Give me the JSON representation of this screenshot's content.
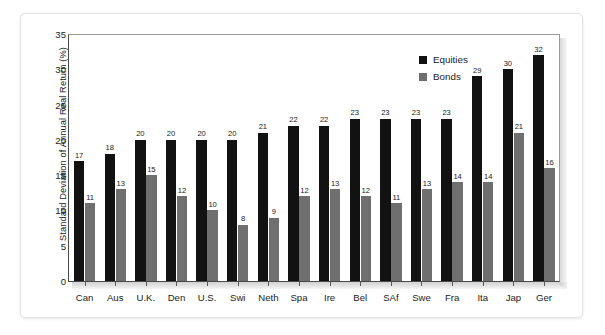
{
  "chart_data": {
    "type": "bar",
    "title": "",
    "xlabel": "",
    "ylabel": "Standard Deviation of Annual Real Return (%)",
    "ylim": [
      0,
      35
    ],
    "yticks": [
      0,
      5,
      10,
      15,
      20,
      25,
      30,
      35
    ],
    "grid": false,
    "legend_position": "top-right",
    "categories": [
      "Can",
      "Aus",
      "U.K.",
      "Den",
      "U.S.",
      "Swi",
      "Neth",
      "Spa",
      "Ire",
      "Bel",
      "SAf",
      "Swe",
      "Fra",
      "Ita",
      "Jap",
      "Ger"
    ],
    "series": [
      {
        "name": "Equities",
        "color": "#121212",
        "values": [
          17,
          18,
          20,
          20,
          20,
          20,
          21,
          22,
          22,
          23,
          23,
          23,
          23,
          29,
          30,
          32
        ]
      },
      {
        "name": "Bonds",
        "color": "#6f6f6f",
        "values": [
          11,
          13,
          15,
          12,
          10,
          8,
          9,
          12,
          13,
          12,
          11,
          13,
          14,
          14,
          21,
          16
        ]
      }
    ]
  },
  "legend": {
    "items": [
      {
        "label": "Equities",
        "color": "#121212"
      },
      {
        "label": "Bonds",
        "color": "#6f6f6f"
      }
    ]
  },
  "axis": {
    "y_label": "Standard Deviation of Annual Real Return (%)",
    "y_ticks": [
      "35",
      "30",
      "25",
      "20",
      "15",
      "10",
      "5",
      "0"
    ]
  }
}
